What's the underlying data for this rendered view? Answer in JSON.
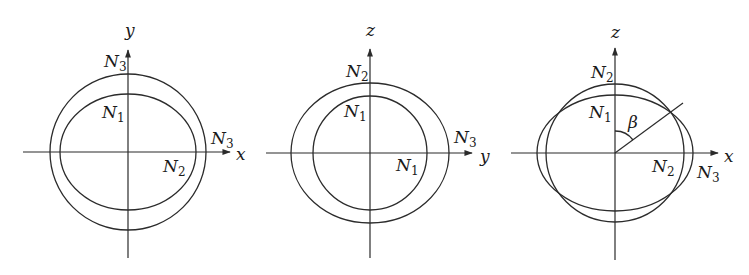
{
  "figure": {
    "colors": {
      "line": "#2b2b2b",
      "text": "#1a1a1a",
      "background": "#ffffff"
    },
    "panels": [
      {
        "id": "xy-plane",
        "axes": {
          "horizontal": "x",
          "vertical": "y"
        },
        "labels": {
          "top": {
            "base": "N",
            "sub": "3"
          },
          "inner_top": {
            "base": "N",
            "sub": "1"
          },
          "right_outer": {
            "base": "N",
            "sub": "3"
          },
          "right_inner": {
            "base": "N",
            "sub": "2"
          }
        },
        "curves": [
          {
            "name": "outer-circle",
            "type": "circle",
            "semi_x": "N3",
            "semi_y": "N3"
          },
          {
            "name": "inner-ellipse",
            "type": "ellipse",
            "semi_x": "N2",
            "semi_y": "N1"
          }
        ]
      },
      {
        "id": "yz-plane",
        "axes": {
          "horizontal": "y",
          "vertical": "z"
        },
        "labels": {
          "top": {
            "base": "N",
            "sub": "2"
          },
          "inner_top": {
            "base": "N",
            "sub": "1"
          },
          "right_outer": {
            "base": "N",
            "sub": "3"
          },
          "right_inner": {
            "base": "N",
            "sub": "1"
          }
        },
        "curves": [
          {
            "name": "outer-ellipse",
            "type": "ellipse",
            "semi_x": "N3",
            "semi_y": "N2"
          },
          {
            "name": "inner-circle",
            "type": "circle",
            "semi_x": "N1",
            "semi_y": "N1"
          }
        ]
      },
      {
        "id": "xz-plane",
        "axes": {
          "horizontal": "x",
          "vertical": "z"
        },
        "labels": {
          "top": {
            "base": "N",
            "sub": "2"
          },
          "inner_top": {
            "base": "N",
            "sub": "1"
          },
          "right_inner": {
            "base": "N",
            "sub": "2"
          },
          "right_outer": {
            "base": "N",
            "sub": "3"
          },
          "angle": "β"
        },
        "curves": [
          {
            "name": "circle",
            "type": "circle",
            "semi_x": "N2",
            "semi_y": "N2"
          },
          {
            "name": "ellipse",
            "type": "ellipse",
            "semi_x": "N3",
            "semi_y": "N1"
          }
        ]
      }
    ]
  }
}
